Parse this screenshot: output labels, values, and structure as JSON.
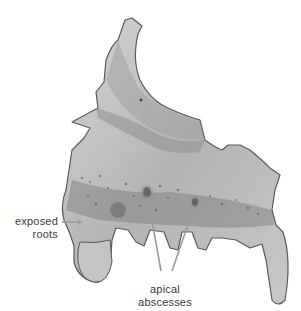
{
  "figure": {
    "colors": {
      "bone_light": "#d2d2d2",
      "bone_mid": "#a9a9a9",
      "bone_dark": "#6e6e6e",
      "outline": "#5a5a5a",
      "leader_line": "#9a9a9a",
      "label_text": "#3a3a3a"
    }
  },
  "labels": {
    "exposed_roots": {
      "line1": "exposed",
      "line2": "roots"
    },
    "apical_abscesses": {
      "line1": "apical",
      "line2": "abscesses"
    }
  }
}
